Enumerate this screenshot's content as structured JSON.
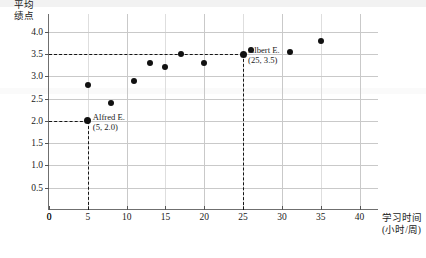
{
  "chart_data": {
    "type": "scatter",
    "title": "",
    "xlabel": "学习时间 (小时/周)",
    "xlabel_line1": "学习时间",
    "xlabel_line2": "(小时/周)",
    "ylabel": "平均绩点",
    "ylabel_line1": "平均",
    "ylabel_line2": "绩点",
    "xlim": [
      0,
      42.5
    ],
    "ylim": [
      0,
      4.4
    ],
    "grid": true,
    "legend": "none",
    "xticks": [
      0,
      5,
      10,
      15,
      20,
      25,
      30,
      35,
      40
    ],
    "xticklabels": [
      "0",
      "5",
      "10",
      "15",
      "20",
      "25",
      "30",
      "35",
      "40"
    ],
    "yticks": [
      0.5,
      1.0,
      1.5,
      2.0,
      2.5,
      3.0,
      3.5,
      4.0
    ],
    "yticklabels": [
      "0.5",
      "1.0",
      "1.5",
      "2.0",
      "2.5",
      "3.0",
      "3.5",
      "4.0"
    ],
    "x": [
      5,
      5,
      8,
      11,
      13,
      15,
      17,
      20,
      25,
      26,
      31,
      35
    ],
    "y": [
      2.0,
      2.8,
      2.4,
      2.9,
      3.3,
      3.2,
      3.5,
      3.3,
      3.5,
      3.6,
      3.55,
      3.8
    ],
    "points": [
      {
        "x": 5,
        "y": 2.0,
        "highlight": true
      },
      {
        "x": 5,
        "y": 2.8,
        "highlight": false
      },
      {
        "x": 8,
        "y": 2.4,
        "highlight": false
      },
      {
        "x": 11,
        "y": 2.9,
        "highlight": false
      },
      {
        "x": 13,
        "y": 3.3,
        "highlight": false
      },
      {
        "x": 15,
        "y": 3.2,
        "highlight": false
      },
      {
        "x": 17,
        "y": 3.5,
        "highlight": false
      },
      {
        "x": 20,
        "y": 3.3,
        "highlight": false
      },
      {
        "x": 25,
        "y": 3.5,
        "highlight": true
      },
      {
        "x": 26,
        "y": 3.6,
        "highlight": false
      },
      {
        "x": 31,
        "y": 3.55,
        "highlight": false
      },
      {
        "x": 35,
        "y": 3.8,
        "highlight": false
      }
    ],
    "annotations": [
      {
        "name": "Alfred E.",
        "coords": "(5, 2.0)",
        "x": 5,
        "y": 2.0
      },
      {
        "name": "Albert E.",
        "coords": "(25, 3.5)",
        "x": 25,
        "y": 3.5
      }
    ],
    "guides": [
      {
        "type": "horizontal",
        "value": 2.0,
        "from_x": 0,
        "to_x": 5,
        "style": "dashed"
      },
      {
        "type": "vertical",
        "value": 5,
        "from_y": 0,
        "to_y": 2.0,
        "style": "dashed"
      },
      {
        "type": "horizontal",
        "value": 3.5,
        "from_x": 0,
        "to_x": 25,
        "style": "dashed"
      },
      {
        "type": "vertical",
        "value": 25,
        "from_y": 0,
        "to_y": 3.5,
        "style": "dashed"
      }
    ]
  },
  "axis": {
    "origin_label": "0"
  },
  "annotation_alfred": {
    "name": "Alfred E.",
    "coords": "(5, 2.0)"
  },
  "annotation_albert": {
    "name": "Albert E.",
    "coords": "(25, 3.5)"
  }
}
